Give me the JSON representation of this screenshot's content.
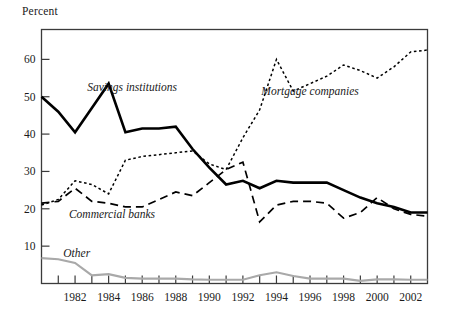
{
  "chart_data": {
    "type": "line",
    "title": "",
    "subtitle": "",
    "xlabel": "",
    "ylabel": "Percent",
    "ylim": [
      0,
      68
    ],
    "xlim": [
      1980,
      2003
    ],
    "grid": false,
    "legend_position": "inline-annotations",
    "ytick_labels": [
      "10",
      "20",
      "30",
      "40",
      "50",
      "60"
    ],
    "ytick_values": [
      10,
      20,
      30,
      40,
      50,
      60
    ],
    "xtick_labels": [
      "1982",
      "1984",
      "1986",
      "1988",
      "1990",
      "1992",
      "1994",
      "1996",
      "1998",
      "2000",
      "2002"
    ],
    "xtick_values": [
      1982,
      1984,
      1986,
      1988,
      1990,
      1992,
      1994,
      1996,
      1998,
      2000,
      2002
    ],
    "xtick_minor_values": [
      1980,
      1981,
      1983,
      1985,
      1987,
      1989,
      1991,
      1993,
      1995,
      1997,
      1999,
      2001,
      2003
    ],
    "x": [
      1980,
      1981,
      1982,
      1983,
      1984,
      1985,
      1986,
      1987,
      1988,
      1989,
      1990,
      1991,
      1992,
      1993,
      1994,
      1995,
      1996,
      1997,
      1998,
      1999,
      2000,
      2001,
      2002,
      2003
    ],
    "series": [
      {
        "name": "Savings institutions",
        "style": "solid",
        "color": "#000000",
        "width": 2.6,
        "label_x": 1985.4,
        "label_y": 51.5,
        "values": [
          50,
          46,
          40.5,
          47,
          53.5,
          40.5,
          41.5,
          41.5,
          42,
          36,
          31,
          26.5,
          27.5,
          25.5,
          27.5,
          27,
          27,
          27,
          25,
          23,
          21.5,
          20.5,
          19,
          19
        ]
      },
      {
        "name": "Mortgage companies",
        "style": "dotted",
        "color": "#000000",
        "width": 1.5,
        "label_x": 1996.0,
        "label_y": 50.5,
        "values": [
          21,
          22.5,
          27.5,
          26.5,
          24,
          33,
          34,
          34.5,
          35,
          35.5,
          32,
          30.5,
          39,
          46.5,
          60,
          51.5,
          53.5,
          55.5,
          58.5,
          57,
          55,
          58,
          62,
          62.5
        ]
      },
      {
        "name": "Commercial banks",
        "style": "dashed",
        "color": "#000000",
        "width": 1.7,
        "label_x": 1984.2,
        "label_y": 17.5,
        "values": [
          21.5,
          22,
          25.5,
          22,
          21.5,
          20.5,
          20.5,
          22.5,
          24.5,
          23.5,
          27,
          30.5,
          32.5,
          16.5,
          21,
          22,
          22,
          21.5,
          17.5,
          19,
          23,
          20,
          18.5,
          18
        ]
      },
      {
        "name": "Other",
        "style": "solid",
        "color": "#a9a9a9",
        "width": 2.2,
        "label_x": 1982.1,
        "label_y": 7.2,
        "values": [
          6.8,
          6.5,
          5.5,
          2.2,
          2.5,
          1.5,
          1.3,
          1.3,
          1.3,
          1.1,
          1.0,
          1.0,
          1.0,
          2.2,
          3.0,
          2.0,
          1.3,
          1.3,
          1.3,
          0.7,
          1.1,
          1.1,
          1.0,
          1.0
        ]
      }
    ]
  }
}
